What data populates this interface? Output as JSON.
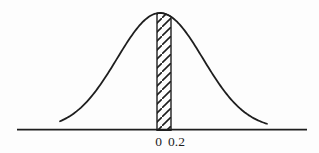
{
  "figure": {
    "background_color": "#fdfdfd",
    "ink_color": "#1e1e1e"
  },
  "chart_data": {
    "type": "area",
    "title": "",
    "xlabel": "",
    "ylabel": "",
    "curve": {
      "kind": "normal-pdf",
      "mean": 0,
      "peak_at_tick": "0",
      "x_range_sigma": [
        -2.4,
        2.5
      ]
    },
    "x_tick_labels": [
      "0",
      "0.2"
    ],
    "shaded_region": {
      "from": 0,
      "to": 0.2,
      "style": "diagonal-hatch",
      "hatch_direction": "bottom-left-to-top-right"
    },
    "axes": {
      "x_axis_visible": true,
      "y_axis_visible": false,
      "grid": false
    },
    "legend": null
  }
}
